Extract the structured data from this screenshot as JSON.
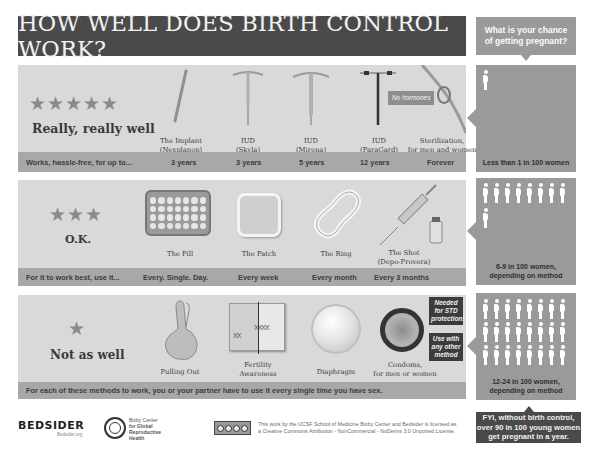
{
  "title": "HOW WELL DOES BIRTH CONTROL WORK?",
  "chance_header": "What is your chance of getting pregnant?",
  "tiers": [
    {
      "rating_label": "Really, really well",
      "stars": 5,
      "usage_prompt": "Works, hassle-free, for up to...",
      "methods": [
        {
          "name_line1": "The Implant",
          "name_line2": "(Nexplanon)",
          "duration": "3 years",
          "icon": "implant-rod-icon"
        },
        {
          "name_line1": "IUD",
          "name_line2": "(Skyla)",
          "duration": "3 years",
          "icon": "iud-icon"
        },
        {
          "name_line1": "IUD",
          "name_line2": "(Mirena)",
          "duration": "5 years",
          "icon": "iud-icon"
        },
        {
          "name_line1": "IUD",
          "name_line2": "(ParaGard)",
          "duration": "12 years",
          "icon": "copper-iud-icon"
        },
        {
          "name_line1": "Sterilization,",
          "name_line2": "for men and women",
          "duration": "Forever",
          "icon": "sterilization-tube-icon"
        }
      ],
      "callout": "No hormones",
      "odds_text_line1": "Less than 1 in 100 women",
      "odds_text_line2": "",
      "figure_count": 1
    },
    {
      "rating_label": "O.K.",
      "stars": 3,
      "usage_prompt": "For it to work best, use it...",
      "methods": [
        {
          "name_line1": "The Pill",
          "name_line2": "",
          "duration": "Every. Single. Day.",
          "icon": "pill-pack-icon"
        },
        {
          "name_line1": "The Patch",
          "name_line2": "",
          "duration": "Every week",
          "icon": "patch-icon"
        },
        {
          "name_line1": "The Ring",
          "name_line2": "",
          "duration": "Every month",
          "icon": "ring-icon"
        },
        {
          "name_line1": "The Shot",
          "name_line2": "(Depo-Provera)",
          "duration": "Every 3 months",
          "icon": "syringe-icon"
        }
      ],
      "odds_text_line1": "6-9 in 100 women,",
      "odds_text_line2": "depending on method",
      "figure_count": 9
    },
    {
      "rating_label": "Not as well",
      "stars": 1,
      "usage_prompt": "For each of these methods to work, you or your partner have to use it every single time you have sex.",
      "methods": [
        {
          "name_line1": "Pulling Out",
          "name_line2": "",
          "icon": "crossed-fingers-icon"
        },
        {
          "name_line1": "Fertility",
          "name_line2": "Awareness",
          "icon": "calendar-icon"
        },
        {
          "name_line1": "Diaphragm",
          "name_line2": "",
          "icon": "diaphragm-icon"
        },
        {
          "name_line1": "Condoms,",
          "name_line2": "for men or women",
          "icon": "condom-icon"
        }
      ],
      "callouts": [
        {
          "line1": "Needed",
          "line2": "for STD",
          "line3": "protection!"
        },
        {
          "line1": "Use with",
          "line2": "any other",
          "line3": "method"
        }
      ],
      "odds_text_line1": "12-24 in 100 women,",
      "odds_text_line2": "depending on method",
      "figure_count": 24
    }
  ],
  "fyi": {
    "line1": "FYI, without birth control,",
    "line2": "over 90 in 100 young women",
    "line3": "get pregnant in a year."
  },
  "footer": {
    "bedsider_logo": "BEDSIDER",
    "bedsider_sub": "Bedsider.org",
    "bixby_line1": "Bixby Center",
    "bixby_line2": "for Global",
    "bixby_line3": "Reproductive",
    "bixby_line4": "Health",
    "license_line1": "This work by the UCSF School of Medicine Bixby Center and Bedsider is licensed as",
    "license_line2": "a Creative Commons Attribution - NonCommercial - NoDerivs 3.0 Unported License.",
    "cc_badge": "cc by nc nd"
  },
  "colors": {
    "title_bg": "#4a4a4a",
    "panel_bg": "#d9d9d9",
    "strip_bg": "#a8a8a8",
    "odds_bg": "#9a9a9a",
    "star": "#8a8a8a"
  }
}
